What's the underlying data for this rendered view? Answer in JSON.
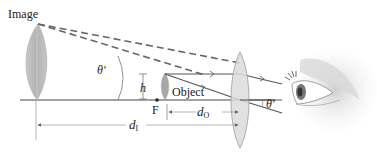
{
  "diagram": {
    "labels": {
      "image": "Image",
      "object": "Object",
      "focal_point": "F",
      "height": "h",
      "theta_prime_left": "θ′",
      "theta_prime_right": "θ′",
      "d_object_main": "d",
      "d_object_sub": "O",
      "d_image_main": "d",
      "d_image_sub": "I"
    },
    "elements": [
      "image-leaf",
      "object-leaf",
      "converging-lens",
      "optical-axis",
      "dashed-virtual-rays",
      "solid-real-rays",
      "eye",
      "focal-point-marker",
      "distance-arrows",
      "angle-arcs"
    ],
    "colors": {
      "ray": "#555555",
      "dashed_ray": "#666666",
      "axis": "#444444",
      "lens_fill": "#dcdcdc",
      "lens_stroke": "#9a9a9a",
      "image_fill": "#bdbdbd",
      "object_fill": "#a8a8a8",
      "text": "#222222"
    }
  }
}
